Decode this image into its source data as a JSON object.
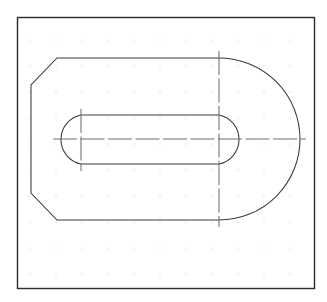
{
  "document": {
    "title": "Technical Drawing — Bracket Plate Outline",
    "background_color": "#ffffff",
    "canvas": {
      "width": 327,
      "height": 302
    }
  },
  "frame": {
    "name": "drawing-border",
    "x": 17,
    "y": 17,
    "width": 297,
    "height": 271,
    "stroke_color": "#2b2b2b",
    "stroke_width": 1.4,
    "fill_color": "#ffffff"
  },
  "grid": {
    "style": "dot",
    "spacing": 26,
    "origin_x": 30,
    "origin_y": 40,
    "columns": 11,
    "rows": 10,
    "dot_radius": 0.6,
    "color": "#b9b9b9"
  },
  "geometry": {
    "stroke_color": "#3a3a3a",
    "stroke_width": 1.05,
    "outer_profile": {
      "name": "outer-d-profile",
      "description": "Rounded-end plate outline with chamfered left corners",
      "top_edge_y": 58,
      "bottom_edge_y": 220,
      "left_edge_x": 31,
      "chamfer_start_x": 57,
      "chamfer_top_end_y": 85,
      "chamfer_bottom_start_y": 193,
      "arc_center_x": 219,
      "arc_center_y": 139,
      "arc_radius": 81,
      "arc_right_x": 302,
      "path": "M 57 58 L 219 58 A 81 81 0 0 1 219 220 L 57 220 L 31 193 L 31 85 Z"
    },
    "inner_slot": {
      "name": "inner-slot-profile",
      "description": "Obround slot with semicircular ends",
      "top_y": 115,
      "bottom_y": 164,
      "left_arc_center_x": 81,
      "right_arc_center_x": 219,
      "arc_center_y": 139,
      "arc_radius": 25,
      "left_extent_x": 55,
      "right_extent_x": 245,
      "path": "M 81 115 L 219 115 A 25 25 0 0 1 219 164 L 81 164 A 25 25 0 0 1 81 115 Z"
    }
  },
  "center_lines": {
    "name": "construction-center-lines",
    "stroke_color": "#6f6f6f",
    "stroke_width": 1.05,
    "dash_pattern": "24 3.5 24 3.5",
    "horizontal": {
      "name": "horizontal-center-line",
      "y": 139,
      "x_start": 53,
      "x_end": 306
    },
    "vertical_main": {
      "name": "vertical-center-line-right",
      "x": 219,
      "y_start": 51,
      "y_end": 227
    },
    "vertical_slot_left": {
      "name": "vertical-center-line-slot-left",
      "x": 81,
      "y_start": 109,
      "y_end": 171
    }
  },
  "chart_data": {
    "type": "table",
    "xlabel": "X (px)",
    "ylabel": "Y (px)",
    "grid": true,
    "legend": "none",
    "xlim": [
      17,
      314
    ],
    "ylim": [
      17,
      288
    ],
    "series": [
      {
        "name": "outer-d-profile",
        "vertices": [
          [
            57,
            58
          ],
          [
            219,
            58
          ],
          [
            302,
            139
          ],
          [
            219,
            220
          ],
          [
            57,
            220
          ],
          [
            31,
            193
          ],
          [
            31,
            85
          ],
          [
            57,
            58
          ]
        ]
      },
      {
        "name": "inner-slot-profile",
        "vertices": [
          [
            81,
            115
          ],
          [
            219,
            115
          ],
          [
            245,
            139
          ],
          [
            219,
            164
          ],
          [
            81,
            164
          ],
          [
            55,
            139
          ],
          [
            81,
            115
          ]
        ]
      },
      {
        "name": "horizontal-center-line",
        "vertices": [
          [
            53,
            139
          ],
          [
            306,
            139
          ]
        ]
      },
      {
        "name": "vertical-center-line-right",
        "vertices": [
          [
            219,
            51
          ],
          [
            219,
            227
          ]
        ]
      },
      {
        "name": "vertical-center-line-slot-left",
        "vertices": [
          [
            81,
            109
          ],
          [
            81,
            171
          ]
        ]
      }
    ]
  }
}
